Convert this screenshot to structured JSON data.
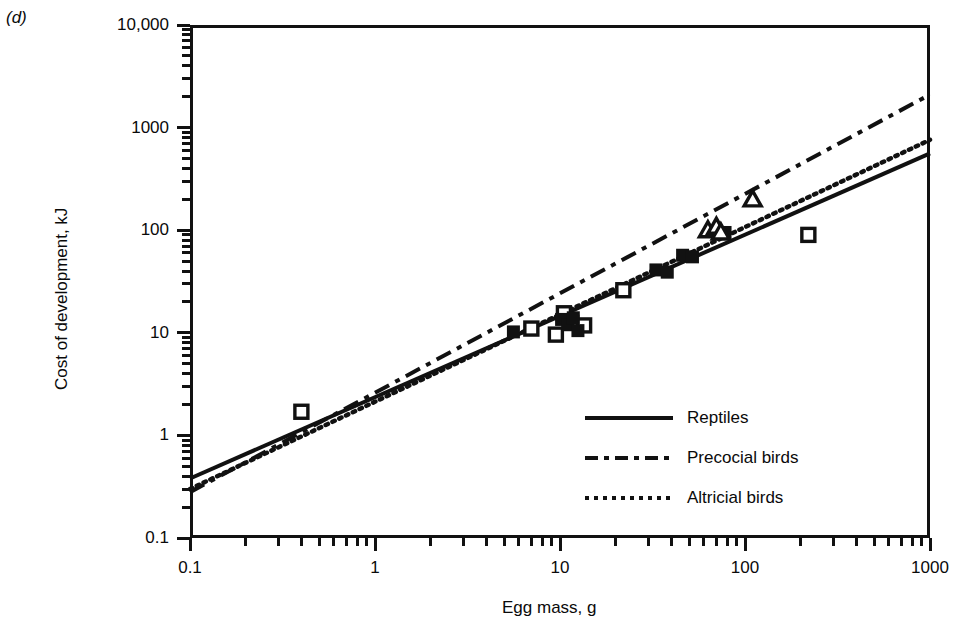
{
  "panel": {
    "label": "(d)"
  },
  "chart_data": {
    "type": "scatter",
    "title": "",
    "xlabel": "Egg mass, g",
    "ylabel": "Cost of development, kJ",
    "xscale": "log",
    "yscale": "log",
    "xlim": [
      0.1,
      1000
    ],
    "ylim": [
      0.1,
      10000
    ],
    "grid": false,
    "legend_position": "inside-lower-right",
    "xticks": [
      "0.1",
      "1",
      "10",
      "100",
      "1000"
    ],
    "yticks": [
      "0.1",
      "1",
      "10",
      "100",
      "1000",
      "10,000"
    ],
    "series": [
      {
        "name": "open squares",
        "marker": "open-square",
        "points": [
          [
            0.4,
            1.7
          ],
          [
            7.0,
            11.0
          ],
          [
            9.5,
            9.6
          ],
          [
            10.5,
            15.5
          ],
          [
            11.5,
            12.5
          ],
          [
            13.5,
            11.8
          ],
          [
            22.0,
            26.0
          ],
          [
            220.0,
            90.0
          ]
        ]
      },
      {
        "name": "filled squares",
        "marker": "filled-square",
        "points": [
          [
            5.6,
            10.2
          ],
          [
            10.2,
            13.5
          ],
          [
            11.0,
            12.0
          ],
          [
            11.8,
            14.0
          ],
          [
            12.5,
            10.5
          ],
          [
            33.0,
            41.0
          ],
          [
            38.0,
            39.0
          ],
          [
            46.0,
            57.0
          ],
          [
            52.0,
            55.0
          ],
          [
            78.0,
            95.0
          ]
        ]
      },
      {
        "name": "open triangles",
        "marker": "open-triangle",
        "points": [
          [
            63.0,
            100.0
          ],
          [
            70.0,
            108.0
          ],
          [
            74.0,
            95.0
          ],
          [
            110.0,
            200.0
          ]
        ]
      }
    ],
    "fit_lines": [
      {
        "name": "Reptiles",
        "style": "solid",
        "x": [
          0.1,
          1000
        ],
        "y": [
          0.38,
          560
        ]
      },
      {
        "name": "Precocial birds",
        "style": "dash-dot",
        "x": [
          0.1,
          1000
        ],
        "y": [
          0.28,
          2100
        ]
      },
      {
        "name": "Altricial birds",
        "style": "dotted",
        "x": [
          0.1,
          1000
        ],
        "y": [
          0.3,
          760
        ]
      }
    ],
    "legend": [
      {
        "label": "Reptiles",
        "style": "solid"
      },
      {
        "label": "Precocial birds",
        "style": "dash-dot"
      },
      {
        "label": "Altricial birds",
        "style": "dotted"
      }
    ]
  }
}
